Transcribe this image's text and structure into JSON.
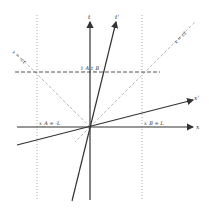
{
  "diagram": {
    "type": "minkowski-spacetime-diagram",
    "axes": {
      "t": "t",
      "x": "x",
      "t_prime": "t'",
      "x_prime": "x'"
    },
    "light_lines": {
      "positive": "x = ct",
      "negative": "x = -ct"
    },
    "markers": {
      "left_vertical": "x_A = -L",
      "right_vertical": "x_B = L"
    },
    "simultaneity": {
      "label_a": "t_A",
      "label_b": "t_B"
    },
    "colors": {
      "axis": "#333333",
      "light_line": "#bbbbbb",
      "dashed_line": "#555555",
      "dotted_line": "#aaaaaa"
    }
  }
}
